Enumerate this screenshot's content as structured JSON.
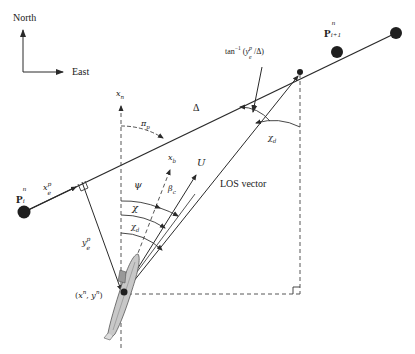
{
  "compass": {
    "north": "North",
    "east": "East"
  },
  "waypoints": {
    "current": {
      "base": "P",
      "sup": "n",
      "sub": "i"
    },
    "next": {
      "base": "P",
      "sup": "n",
      "sub": "i+1"
    }
  },
  "labels": {
    "xn_axis": {
      "base": "x",
      "sub": "n"
    },
    "xb_axis": {
      "base": "x",
      "sub": "b"
    },
    "speed": "U",
    "delta": "Δ",
    "pi_p": {
      "base": "π",
      "sub": "p"
    },
    "psi": "ψ",
    "chi": "χ",
    "chi_d": {
      "base": "χ",
      "sub": "d"
    },
    "beta_c": {
      "base": "β",
      "sub": "c"
    },
    "along_track": {
      "base": "x",
      "sup": "p",
      "sub": "e"
    },
    "cross_track": {
      "base": "y",
      "sup": "p",
      "sub": "e"
    },
    "los_vector": "LOS vector",
    "atan_prefix": "tan",
    "atan_exp": "−1",
    "atan_arg_open": " (",
    "atan_arg_y": "y",
    "atan_arg_sup": "p",
    "atan_arg_sub": "e",
    "atan_arg_rest": "/Δ)",
    "position": {
      "open": "(",
      "x": "x",
      "xsup": "n",
      "comma": ", ",
      "y": "y",
      "ysup": "n",
      "close": ")"
    }
  },
  "colors": {
    "line": "#2a2a2a",
    "dash": "#444444",
    "dot": "#1f1f1f",
    "vessel_fill": "#c8c8c8",
    "vessel_stroke": "#555555"
  }
}
